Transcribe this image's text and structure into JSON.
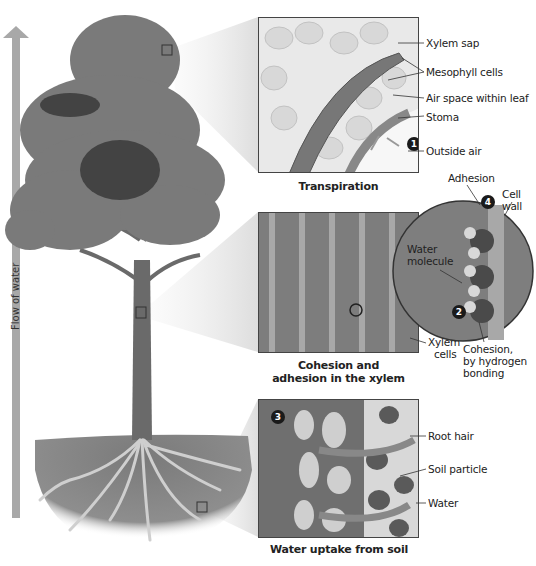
{
  "figure": {
    "flow_arrow_label": "Flow of water",
    "colors": {
      "arrow": "#a8a8a8",
      "soil": "#8a8a8a",
      "foliage": "#777777",
      "trunk": "#6a6a6a",
      "outline": "#444444"
    }
  },
  "panels": {
    "transpiration": {
      "caption": "Transpiration",
      "labels": [
        "Xylem sap",
        "Mesophyll cells",
        "Air space within leaf",
        "Stoma",
        "Outside air"
      ],
      "step_badge": "1"
    },
    "xylem": {
      "caption_line1": "Cohesion and",
      "caption_line2": "adhesion in the xylem",
      "labels": {
        "xylem_cells_1": "Xylem",
        "xylem_cells_2": "cells"
      }
    },
    "molecule_zoom": {
      "labels": {
        "adhesion": "Adhesion",
        "cell_wall_1": "Cell",
        "cell_wall_2": "wall",
        "water_molecule_1": "Water",
        "water_molecule_2": "molecule",
        "cohesion_1": "Cohesion,",
        "cohesion_2": "by hydrogen",
        "cohesion_3": "bonding"
      },
      "step_badges": {
        "cohesion": "2",
        "adhesion": "4"
      }
    },
    "soil": {
      "caption": "Water uptake from soil",
      "labels": [
        "Root hair",
        "Soil particle",
        "Water"
      ],
      "step_badge": "3"
    }
  }
}
